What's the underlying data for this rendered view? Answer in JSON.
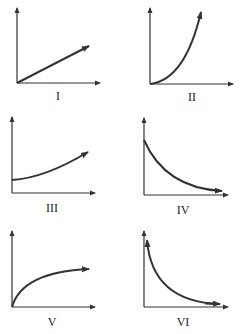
{
  "figure": {
    "stroke_color": "#333333",
    "graphs": [
      {
        "label": "I",
        "shape": "straight line through origin, increasing"
      },
      {
        "label": "II",
        "shape": "concave-up curve from origin, increasing (parabolic)"
      },
      {
        "label": "III",
        "shape": "curve with positive y-intercept, gently increasing"
      },
      {
        "label": "IV",
        "shape": "exponential decay from positive y-intercept"
      },
      {
        "label": "V",
        "shape": "concave-down curve from origin, increasing (square-root-like)"
      },
      {
        "label": "VI",
        "shape": "hyperbolic decay approaching both axes"
      }
    ]
  }
}
